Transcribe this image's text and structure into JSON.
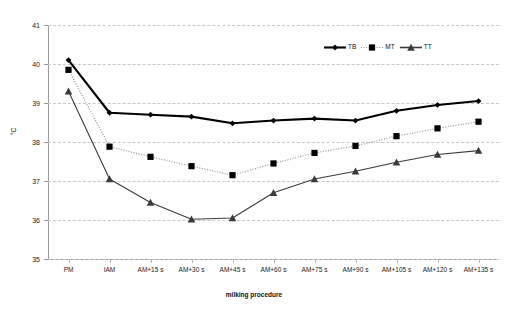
{
  "chart_data": {
    "type": "line",
    "title": "",
    "xlabel": "milking procedure",
    "ylabel": "°C",
    "ylim": [
      35,
      41
    ],
    "yticks": [
      35,
      36,
      37,
      38,
      39,
      40,
      41
    ],
    "grid": true,
    "legend_position": "top-right",
    "categories": [
      "PM",
      "IAM",
      "AM+15 s",
      "AM+30 s",
      "AM+45 s",
      "AM+60 s",
      "AM+75 s",
      "AM+90 s",
      "AM+105 s",
      "AM+120 s",
      "AM+135 s"
    ],
    "series": [
      {
        "name": "TB",
        "marker": "diamond",
        "line_style": "solid-thick",
        "color": "#000000",
        "values": [
          40.1,
          38.75,
          38.7,
          38.65,
          38.48,
          38.55,
          38.6,
          38.55,
          38.8,
          38.95,
          39.05
        ]
      },
      {
        "name": "MT",
        "marker": "square",
        "line_style": "dotted",
        "color": "#000000",
        "values": [
          39.85,
          37.88,
          37.62,
          37.38,
          37.15,
          37.45,
          37.72,
          37.9,
          38.15,
          38.35,
          38.52
        ]
      },
      {
        "name": "TT",
        "marker": "triangle",
        "line_style": "solid-thin",
        "color": "#3b3b3b",
        "values": [
          39.3,
          37.05,
          36.45,
          36.02,
          36.05,
          36.7,
          37.05,
          37.25,
          37.48,
          37.68,
          37.78
        ]
      }
    ]
  },
  "legend": {
    "entries": [
      {
        "label": "TB"
      },
      {
        "label": "MT"
      },
      {
        "label": "TT"
      }
    ]
  }
}
